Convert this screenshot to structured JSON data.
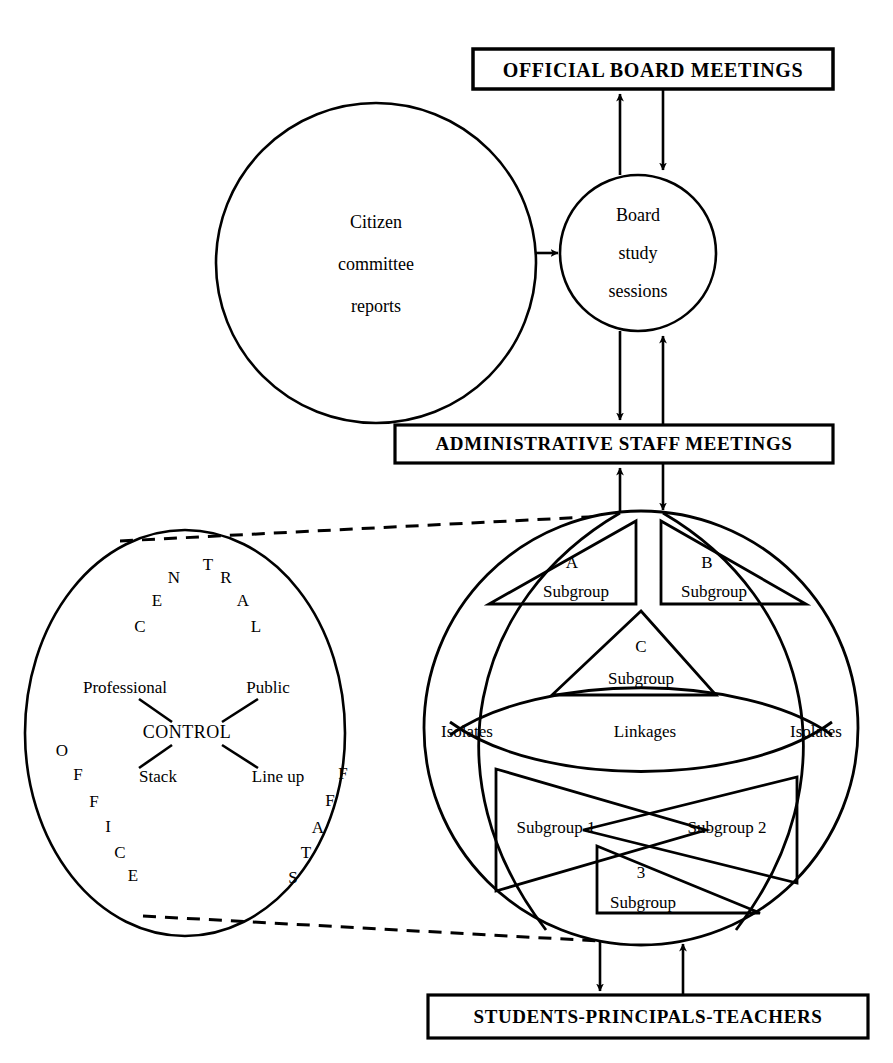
{
  "diagram": {
    "title_top": "OFFICIAL BOARD MEETINGS",
    "title_middle": "ADMINISTRATIVE STAFF MEETINGS",
    "title_bottom": "STUDENTS-PRINCIPALS-TEACHERS",
    "citizen_circle": {
      "line1": "Citizen",
      "line2": "committee",
      "line3": "reports"
    },
    "board_circle": {
      "line1": "Board",
      "line2": "study",
      "line3": "sessions"
    },
    "central_office_circle": {
      "arc_top_word": "CENTRAL",
      "arc_top_letters": [
        "C",
        "E",
        "N",
        "T",
        "R",
        "A",
        "L"
      ],
      "arc_left_word": "OFFICE",
      "arc_left_letters": [
        "O",
        "F",
        "F",
        "I",
        "C",
        "E"
      ],
      "arc_right_word": "STAFF",
      "arc_right_letters": [
        "S",
        "T",
        "A",
        "F",
        "F"
      ],
      "center_label": "CONTROL",
      "spokes": [
        "Professional",
        "Public",
        "Stack",
        "Line up"
      ]
    },
    "subgroup_circle": {
      "subgroup_a": {
        "letter": "A",
        "label": "Subgroup"
      },
      "subgroup_b": {
        "letter": "B",
        "label": "Subgroup"
      },
      "subgroup_c": {
        "letter": "C",
        "label": "Subgroup"
      },
      "subgroup_1": "Subgroup 1",
      "subgroup_2": "Subgroup 2",
      "subgroup_3": {
        "letter": "3",
        "label": "Subgroup"
      },
      "isolates_left": "Isolates",
      "isolates_right": "Isolates",
      "linkages": "Linkages"
    },
    "colors": {
      "ink": "#000000",
      "paper": "#ffffff"
    }
  }
}
